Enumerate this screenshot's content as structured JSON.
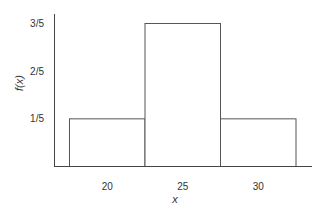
{
  "chart_data": {
    "type": "bar",
    "title": "",
    "xlabel": "x",
    "ylabel": "f(x)",
    "categories": [
      "20",
      "25",
      "30"
    ],
    "values": [
      0.2,
      0.6,
      0.2
    ],
    "value_labels": [
      "1/5",
      "3/5",
      "1/5"
    ],
    "y_ticks": [
      {
        "value": 0.2,
        "label": "1/5"
      },
      {
        "value": 0.4,
        "label": "2/5"
      },
      {
        "value": 0.6,
        "label": "3/5"
      }
    ],
    "ylim": [
      0,
      0.6
    ],
    "grid": false,
    "legend": null,
    "bar_style": {
      "fill": "#ffffff",
      "stroke": "#555555",
      "adjacent": true
    }
  }
}
